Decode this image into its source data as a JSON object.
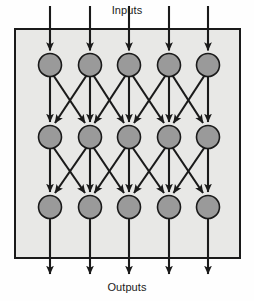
{
  "figure": {
    "title_top": "Inputs",
    "title_bottom": "Outputs",
    "type": "neural-network-diagram",
    "width": 254,
    "height": 301
  },
  "colors": {
    "page_background": "#fefefe",
    "panel_fill": "#e8e8e6",
    "panel_stroke": "#1a1a1a",
    "node_fill": "#9a9a9a",
    "node_stroke": "#1a1a1a",
    "edge_stroke": "#1a1a1a",
    "label_color": "#1a1a1a"
  },
  "panel": {
    "x": 15,
    "y": 29,
    "width": 225,
    "height": 229,
    "stroke_width": 2
  },
  "geometry": {
    "columns_x": [
      50,
      90,
      129,
      169,
      208
    ],
    "rows_y": [
      65,
      137,
      207
    ],
    "node_radius": 11.5,
    "input_arrow_start_y": 6,
    "output_arrow_end_y": 274,
    "edge_stroke_width": 2.1,
    "arrow_head_length": 7.5,
    "arrow_head_width": 7
  },
  "chart_data": {
    "type": "diagram",
    "layers": [
      {
        "name": "layer-1",
        "index": 0,
        "node_count": 5,
        "nodes": [
          "n1-1",
          "n1-2",
          "n1-3",
          "n1-4",
          "n1-5"
        ]
      },
      {
        "name": "layer-2",
        "index": 1,
        "node_count": 5,
        "nodes": [
          "n2-1",
          "n2-2",
          "n2-3",
          "n2-4",
          "n2-5"
        ]
      },
      {
        "name": "layer-3",
        "index": 2,
        "node_count": 5,
        "nodes": [
          "n3-1",
          "n3-2",
          "n3-3",
          "n3-4",
          "n3-5"
        ]
      }
    ],
    "connection_rule": "each node connects downward to itself and to its immediate left and right neighbours",
    "input_arrows": 5,
    "output_arrows": 5,
    "annotations": [
      "Inputs",
      "Outputs"
    ]
  }
}
